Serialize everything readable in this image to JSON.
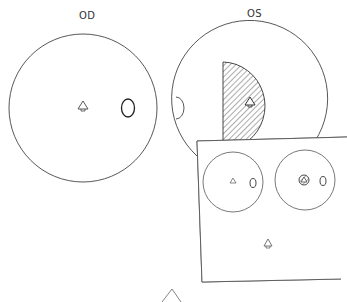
{
  "labels": {
    "right_eye": "OD",
    "left_eye": "OS"
  },
  "diagram": {
    "type": "visual field plot",
    "panels": [
      {
        "eye": "OD",
        "features": [
          "fixation-point",
          "blind-spot"
        ]
      },
      {
        "eye": "OS",
        "features": [
          "fixation-point",
          "blind-spot",
          "hatched-central-defect"
        ]
      }
    ],
    "inset": {
      "features": [
        "small-field-OD",
        "small-field-OS-with-central-scotoma",
        "fixation-target"
      ]
    }
  },
  "colors": {
    "line": "#333333",
    "background": "#ffffff"
  }
}
